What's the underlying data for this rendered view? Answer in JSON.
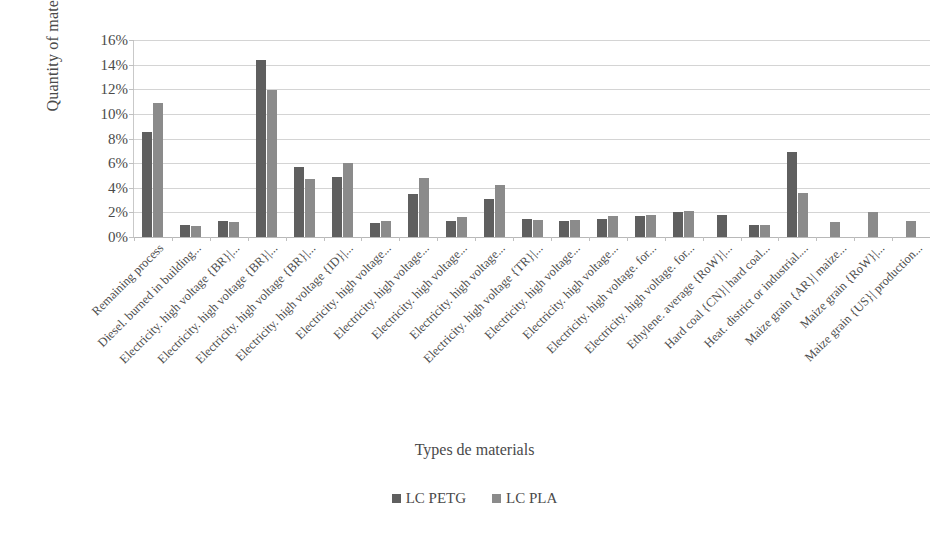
{
  "chart_data": {
    "type": "bar",
    "title": "",
    "xlabel": "Types de materials",
    "ylabel": "Quantity of materials (%)",
    "ylim": [
      0,
      16
    ],
    "ytick_labels": [
      "0%",
      "2%",
      "4%",
      "6%",
      "8%",
      "10%",
      "12%",
      "14%",
      "16%"
    ],
    "ytick_values": [
      0,
      2,
      4,
      6,
      8,
      10,
      12,
      14,
      16
    ],
    "grid": true,
    "legend_position": "bottom",
    "colors": {
      "LC PETG": "#5f5f5f",
      "LC PLA": "#8b8b8b"
    },
    "categories": [
      "Remaining process",
      "Diesel. burned in building...",
      "Electricity. high voltage {BR}|...",
      "Electricity. high voltage {BR}|...",
      "Electricity. high voltage {BR}|...",
      "Electricity. high voltage {ID}|...",
      "Electricity. high voltage...",
      "Electricity. high voltage...",
      "Electricity. high voltage...",
      "Electricity. high voltage...",
      "Electricity. high voltage {TR}|...",
      "Electricity. high voltage...",
      "Electricity. high voltage...",
      "Electricity. high voltage. for...",
      "Electricity. high voltage. for...",
      "Ethylene. average {RoW}|...",
      "Hard coal {CN}| hard coal...",
      "Heat. district or industrial....",
      "Maize grain {AR}| maize...",
      "Maize grain {RoW}|...",
      "Maize grain {US}| production..."
    ],
    "series": [
      {
        "name": "LC PETG",
        "color": "#5f5f5f",
        "values": [
          8.5,
          1.0,
          1.3,
          14.4,
          5.7,
          4.9,
          1.1,
          3.5,
          1.3,
          3.1,
          1.5,
          1.3,
          1.5,
          1.7,
          2.0,
          1.8,
          1.0,
          6.9,
          0,
          0,
          0
        ]
      },
      {
        "name": "LC PLA",
        "color": "#8b8b8b",
        "values": [
          10.9,
          0.9,
          1.2,
          11.9,
          4.7,
          6.0,
          1.3,
          4.8,
          1.6,
          4.2,
          1.4,
          1.4,
          1.7,
          1.8,
          2.1,
          0,
          1.0,
          3.6,
          1.2,
          2.0,
          1.3
        ]
      }
    ]
  },
  "legend": {
    "items": [
      {
        "label": "LC PETG"
      },
      {
        "label": "LC PLA"
      }
    ]
  }
}
